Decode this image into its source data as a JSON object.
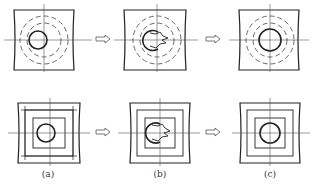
{
  "figure": {
    "panels": [
      {
        "id": "a",
        "label": "(a)",
        "state": "original hole"
      },
      {
        "id": "b",
        "label": "(b)",
        "state": "hole being enlarged (material removal)"
      },
      {
        "id": "c",
        "label": "(c)",
        "state": "enlarged hole"
      }
    ],
    "rows": [
      {
        "name": "circular-guides",
        "description": "hole with concentric dashed circles"
      },
      {
        "name": "square-grid",
        "description": "hole with nested square grid lines"
      }
    ],
    "arrow_glyph": "⇨",
    "colors": {
      "line": "#222222",
      "dashed": "#444444",
      "background": "#ffffff"
    }
  }
}
